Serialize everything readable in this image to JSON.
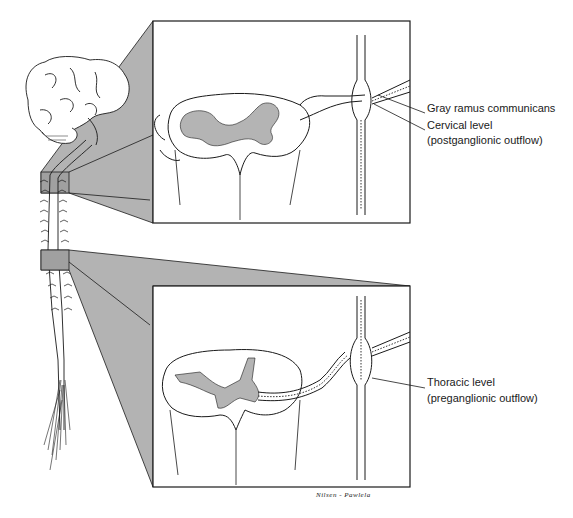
{
  "diagram": {
    "colors": {
      "projection_fill": "#b3b3b3",
      "line": "#1a1a1a",
      "background": "#ffffff"
    },
    "panels": [
      {
        "id": "cervical",
        "box": {
          "x": 153,
          "y": 21,
          "w": 257,
          "h": 202
        },
        "source_box": {
          "x": 41,
          "y": 172,
          "w": 28,
          "h": 21
        },
        "labels": [
          {
            "text": "Gray ramus communicans",
            "x": 427,
            "y": 108
          },
          {
            "text": "Cervical level",
            "x": 427,
            "y": 125
          },
          {
            "text": "(postganglionic outflow)",
            "x": 427,
            "y": 140
          }
        ]
      },
      {
        "id": "thoracic",
        "box": {
          "x": 153,
          "y": 286,
          "w": 257,
          "h": 201
        },
        "source_box": {
          "x": 41,
          "y": 250,
          "w": 28,
          "h": 20
        },
        "labels": [
          {
            "text": "Thoracic level",
            "x": 427,
            "y": 382
          },
          {
            "text": "(preganglionic outflow)",
            "x": 427,
            "y": 398
          }
        ]
      }
    ],
    "signature": "Nilsen - Pawlela"
  }
}
